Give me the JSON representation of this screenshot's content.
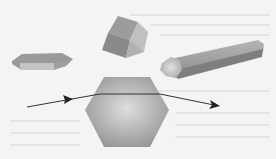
{
  "diagram": {
    "shapes": [
      {
        "name": "hexagonal-plate",
        "label": "Hexagonal plate crystal"
      },
      {
        "name": "cube-crystal",
        "label": "Cubic crystal"
      },
      {
        "name": "hexagonal-column",
        "label": "Hexagonal column crystal"
      },
      {
        "name": "hexagon-cross-section",
        "label": "Hexagonal cross-section"
      }
    ],
    "ray": {
      "label": "Light ray",
      "direction": "left-to-right"
    },
    "colors": {
      "background": "#f4f4f4",
      "crystal_dark": "#8a8a8a",
      "crystal_mid": "#a8a8a8",
      "crystal_light": "#d0d0d0",
      "ray": "#333333"
    }
  }
}
